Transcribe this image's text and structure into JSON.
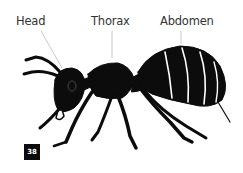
{
  "diagram": {
    "labels": [
      {
        "text": "Head"
      },
      {
        "text": "Thorax"
      },
      {
        "text": "Abdomen"
      }
    ],
    "page_number": "38",
    "colors": {
      "ink": "#0c0c0c",
      "label": "#333333",
      "leader_line": "#bbbbbb",
      "background": "#ffffff"
    }
  }
}
